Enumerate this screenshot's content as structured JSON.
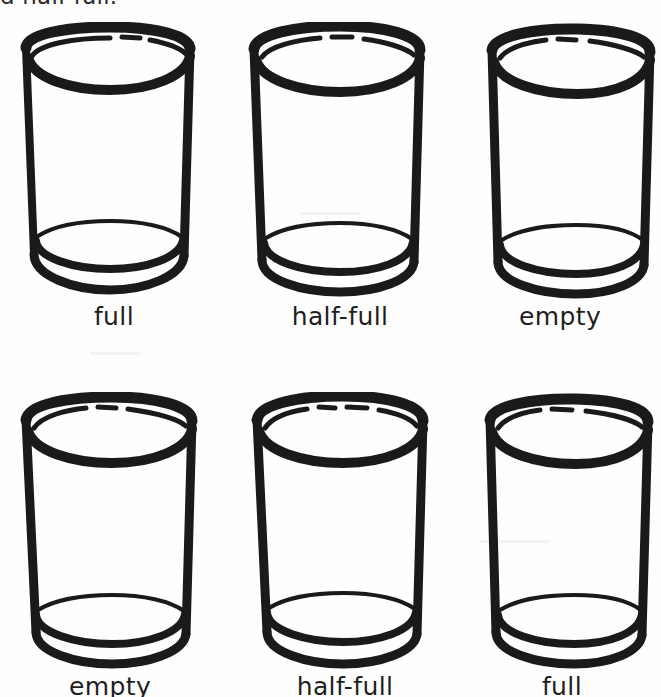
{
  "page": {
    "background_color": "#fefefe",
    "ink_color": "#1a1a1a",
    "clipped_caption": "d half-full.",
    "width": 661,
    "height": 697
  },
  "figure": {
    "icon_name": "drinking-glass-icon",
    "rows": [
      {
        "row_index": 1,
        "items": [
          {
            "label": "full",
            "state": "full",
            "x": 14,
            "y": 22
          },
          {
            "label": "half-full",
            "state": "half-full",
            "x": 240,
            "y": 22
          },
          {
            "label": "empty",
            "state": "empty",
            "x": 460,
            "y": 22
          }
        ]
      },
      {
        "row_index": 2,
        "items": [
          {
            "label": "empty",
            "state": "empty",
            "x": 10,
            "y": 392
          },
          {
            "label": "half-full",
            "state": "half-full",
            "x": 245,
            "y": 392
          },
          {
            "label": "full",
            "state": "full",
            "x": 462,
            "y": 392
          }
        ]
      }
    ]
  }
}
